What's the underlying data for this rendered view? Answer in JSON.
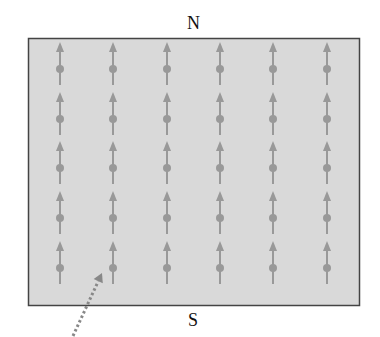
{
  "labels": {
    "north": "N",
    "south": "S"
  },
  "grid": {
    "columns": [
      60,
      113,
      167,
      220,
      273,
      327
    ],
    "rows": [
      69,
      119,
      168,
      218,
      268
    ]
  },
  "colors": {
    "field": "#d9d9d9",
    "frame": "#444444",
    "dipole": "#999999",
    "pointer": "#888888"
  },
  "pointer": {
    "from": [
      73,
      336
    ],
    "to": [
      102,
      273
    ]
  }
}
